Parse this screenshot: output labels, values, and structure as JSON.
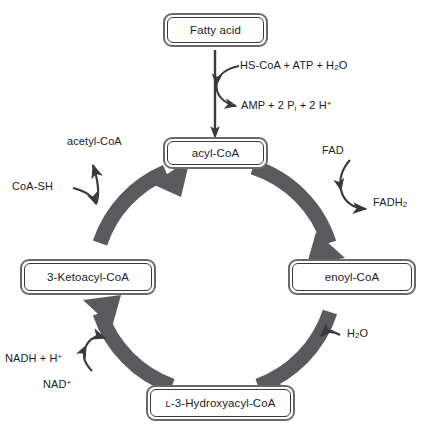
{
  "diagram": {
    "colors": {
      "cycle_arrow": "#5a5a5e",
      "box_outer_border": "#6a6a6e",
      "box_inner_border": "#3a3a3c",
      "text": "#1c1c1e",
      "thin_arrow": "#3a3a3c",
      "background": "#ffffff"
    }
  },
  "nodes": {
    "fatty_acid": {
      "label": "Fatty acid"
    },
    "acyl_coa": {
      "label": "acyl-CoA"
    },
    "enoyl_coa": {
      "label": "enoyl-CoA"
    },
    "hydroxyacyl_coa": {
      "label_prefix": "L",
      "label_rest": "-3-Hydroxyacyl-CoA"
    },
    "ketoacyl_coa": {
      "label": "3-Ketoacyl-CoA"
    }
  },
  "reactions": {
    "activation": {
      "substrates_html": "HS-CoA + ATP + H<sub>2</sub>O",
      "products_html": "AMP + 2 P<sub>i</sub> + 2 H<sup>+</sup>"
    },
    "dehydrogenation": {
      "substrate_html": "FAD",
      "product_html": "FADH<sub>2</sub>"
    },
    "hydration": {
      "substrate_html": "H<sub>2</sub>O"
    },
    "oxidation": {
      "substrate_html": "NAD<sup>+</sup>",
      "product_html": "NADH + H<sup>+</sup>"
    },
    "thiolysis": {
      "substrate_html": "CoA-SH",
      "product_html": "acetyl-CoA"
    }
  }
}
